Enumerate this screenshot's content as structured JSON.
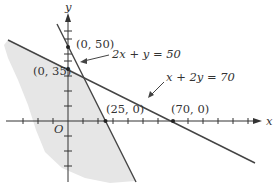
{
  "diagram": {
    "type": "linear-inequality-graph",
    "axes": {
      "x_label": "x",
      "y_label": "y",
      "origin_label": "O",
      "tick_spacing_units": 10
    },
    "lines": [
      {
        "equation": "2x + y = 50",
        "intercepts": [
          "(0, 50)",
          "(25, 0)"
        ]
      },
      {
        "equation": "x + 2y = 70",
        "intercepts": [
          "(0, 35)",
          "(70, 0)"
        ]
      }
    ],
    "points": {
      "y50": "(0, 50)",
      "y35": "(0, 35)",
      "x25": "(25, 0)",
      "x70": "(70, 0)"
    },
    "labels": {
      "eq1": "2x + y = 50",
      "eq2": "x + 2y = 70"
    },
    "colors": {
      "shade": "#e6e6e6",
      "line": "#444444",
      "axis": "#333333"
    }
  }
}
